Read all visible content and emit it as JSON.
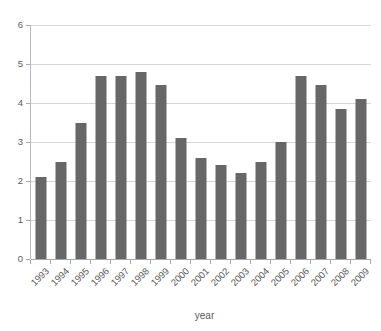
{
  "chart_data": {
    "type": "bar",
    "title": "",
    "subtitle": "",
    "xlabel": "year",
    "ylabel": "",
    "categories": [
      "1993",
      "1994",
      "1995",
      "1996",
      "1997",
      "1998",
      "1999",
      "2000",
      "2001",
      "2002",
      "2003",
      "2004",
      "2005",
      "2006",
      "2007",
      "2008",
      "2009"
    ],
    "values": [
      2.1,
      2.5,
      3.5,
      4.7,
      4.7,
      4.8,
      4.45,
      3.1,
      2.6,
      2.4,
      2.2,
      2.5,
      3.0,
      4.7,
      4.45,
      3.85,
      4.1
    ],
    "series": [
      {
        "name": "",
        "values": [
          2.1,
          2.5,
          3.5,
          4.7,
          4.7,
          4.8,
          4.45,
          3.1,
          2.6,
          2.4,
          2.2,
          2.5,
          3.0,
          4.7,
          4.45,
          3.85,
          4.1
        ]
      }
    ],
    "ylim": [
      0,
      6
    ],
    "ytick_labels": [
      "0",
      "1",
      "2",
      "3",
      "4",
      "5",
      "6"
    ],
    "ytick_values": [
      0,
      1,
      2,
      3,
      4,
      5,
      6
    ],
    "grid": true,
    "grid_axis": "y",
    "legend": false,
    "legend_position": "none",
    "annotations": [],
    "colors": {
      "bar": "#676767",
      "gridline": "#d6d6d6",
      "axis": "#a8a8a8",
      "tick_text": "#595959",
      "background": "#ffffff"
    }
  }
}
